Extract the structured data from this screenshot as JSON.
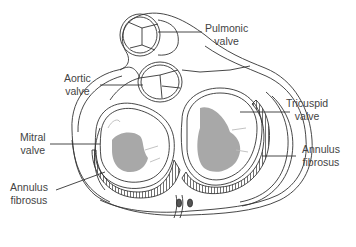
{
  "diagram": {
    "labels": {
      "pulmonic": {
        "line1": "Pulmonic",
        "line2": "valve"
      },
      "aortic": {
        "line1": "Aortic",
        "line2": "valve"
      },
      "mitral": {
        "line1": "Mitral",
        "line2": "valve"
      },
      "annulus_left": {
        "line1": "Annulus",
        "line2": "fibrosus"
      },
      "tricuspid": {
        "line1": "Tricuspid",
        "line2": "valve"
      },
      "annulus_right": {
        "line1": "Annulus",
        "line2": "fibrosus"
      }
    },
    "colors": {
      "outline": "#333333",
      "leaflet_fill": "#a8a8a8",
      "text": "#444444",
      "background": "#ffffff"
    }
  }
}
